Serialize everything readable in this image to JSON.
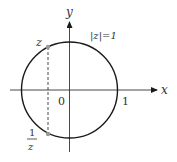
{
  "diagram": {
    "axes": {
      "x_label": "x",
      "y_label": "y"
    },
    "circle_label": "|z|=1",
    "origin_label": "0",
    "unit_label": "1",
    "point_z_label": "z",
    "point_inv_num": "1",
    "point_inv_den": "z",
    "colors": {
      "stroke": "#1a1a1a",
      "point": "#999999",
      "text": "#333333"
    }
  }
}
